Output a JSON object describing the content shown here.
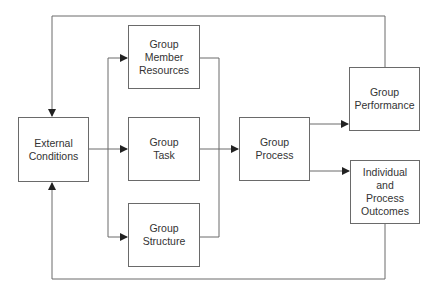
{
  "diagram": {
    "nodes": [
      {
        "id": "external",
        "label": "External\nConditions"
      },
      {
        "id": "resources",
        "label": "Group\nMember\nResources"
      },
      {
        "id": "task",
        "label": "Group\nTask"
      },
      {
        "id": "structure",
        "label": "Group\nStructure"
      },
      {
        "id": "process",
        "label": "Group\nProcess"
      },
      {
        "id": "performance",
        "label": "Group\nPerformance"
      },
      {
        "id": "outcomes",
        "label": "Individual\nand\nProcess\nOutcomes"
      }
    ],
    "edges": [
      {
        "from": "external",
        "to": "resources"
      },
      {
        "from": "external",
        "to": "task"
      },
      {
        "from": "external",
        "to": "structure"
      },
      {
        "from": "resources",
        "to": "process"
      },
      {
        "from": "task",
        "to": "process"
      },
      {
        "from": "structure",
        "to": "process"
      },
      {
        "from": "process",
        "to": "performance"
      },
      {
        "from": "process",
        "to": "outcomes"
      },
      {
        "from": "performance",
        "to": "external"
      },
      {
        "from": "outcomes",
        "to": "external"
      }
    ],
    "line_color": "#6a6a6a"
  }
}
